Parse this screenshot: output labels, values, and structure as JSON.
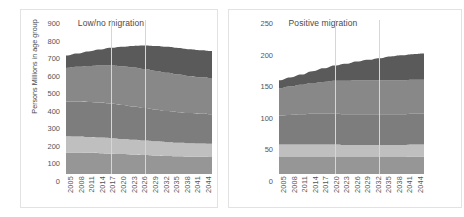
{
  "chart_data": [
    {
      "type": "area",
      "title": "Low/no migration",
      "xlabel": "",
      "ylabel": "Persons Millions in age group",
      "stacked": true,
      "grid": false,
      "legend_position": "right-shared",
      "ylim": [
        0,
        900
      ],
      "yticks": [
        0,
        100,
        200,
        300,
        400,
        500,
        600,
        700,
        800,
        900
      ],
      "x": [
        2005,
        2008,
        2011,
        2014,
        2017,
        2020,
        2023,
        2026,
        2029,
        2032,
        2035,
        2038,
        2041,
        2044
      ],
      "categories": [
        "2005",
        "2008",
        "2011",
        "2014",
        "2017",
        "2020",
        "2023",
        "2026",
        "2029",
        "2032",
        "2035",
        "2038",
        "2041",
        "2044"
      ],
      "series": [
        {
          "name": "0-14 yrs",
          "values": [
            137,
            136,
            134,
            132,
            129,
            126,
            123,
            120,
            117,
            114,
            112,
            110,
            109,
            108
          ]
        },
        {
          "name": "15-24 yrs",
          "values": [
            102,
            101,
            100,
            99,
            98,
            96,
            94,
            92,
            90,
            88,
            86,
            85,
            84,
            83
          ]
        },
        {
          "name": "25-44 yrs",
          "values": [
            220,
            222,
            223,
            222,
            220,
            216,
            211,
            206,
            201,
            197,
            194,
            191,
            189,
            188
          ]
        },
        {
          "name": "45-69 yrs",
          "values": [
            213,
            220,
            228,
            235,
            241,
            245,
            247,
            247,
            245,
            242,
            238,
            234,
            231,
            229
          ]
        },
        {
          "name": "70-plus yrs",
          "values": [
            79,
            85,
            92,
            101,
            112,
            124,
            137,
            149,
            158,
            165,
            169,
            171,
            172,
            172
          ]
        }
      ],
      "totals": [
        751,
        764,
        777,
        789,
        800,
        807,
        812,
        814,
        811,
        806,
        799,
        791,
        785,
        780
      ]
    },
    {
      "type": "area",
      "title": "Positive migration",
      "xlabel": "",
      "ylabel": "",
      "stacked": true,
      "grid": false,
      "legend_position": "right-shared",
      "ylim": [
        0,
        250
      ],
      "yticks": [
        0,
        50,
        100,
        150,
        200,
        250
      ],
      "x": [
        2005,
        2008,
        2011,
        2014,
        2017,
        2020,
        2023,
        2026,
        2029,
        2032,
        2035,
        2038,
        2041,
        2044
      ],
      "categories": [
        "2005",
        "2008",
        "2011",
        "2014",
        "2017",
        "2020",
        "2023",
        "2026",
        "2029",
        "2032",
        "2035",
        "2038",
        "2041",
        "2044"
      ],
      "series": [
        {
          "name": "0-14 yrs",
          "values": [
            30,
            30,
            30,
            30,
            30,
            30,
            30,
            30,
            30,
            30,
            30,
            30,
            31,
            31
          ]
        },
        {
          "name": "15-24 yrs",
          "values": [
            22,
            22,
            22,
            22,
            22,
            22,
            21,
            21,
            21,
            21,
            21,
            21,
            21,
            21
          ]
        },
        {
          "name": "25-44 yrs",
          "values": [
            51,
            52,
            53,
            54,
            54,
            54,
            54,
            54,
            54,
            54,
            54,
            54,
            54,
            54
          ]
        },
        {
          "name": "45-69 yrs",
          "values": [
            48,
            50,
            52,
            54,
            56,
            58,
            59,
            60,
            60,
            60,
            60,
            60,
            60,
            60
          ]
        },
        {
          "name": "70-plus yrs",
          "values": [
            14,
            16,
            18,
            21,
            24,
            27,
            30,
            33,
            36,
            39,
            42,
            44,
            45,
            46
          ]
        }
      ],
      "totals": [
        165,
        170,
        175,
        181,
        186,
        191,
        194,
        198,
        201,
        204,
        207,
        209,
        211,
        212
      ]
    }
  ],
  "legend": {
    "items": [
      {
        "label": "70-plus yrs",
        "color": "#5a5a5a"
      },
      {
        "label": "45-69 yrs",
        "color": "#888888"
      },
      {
        "label": "25-44 yrs",
        "color": "#7d7d7d"
      },
      {
        "label": "15-24 yrs",
        "color": "#bfbfbf"
      },
      {
        "label": "0-14 yrs",
        "color": "#969696"
      }
    ]
  },
  "colors": {
    "band_0_14": "#969696",
    "band_15_24": "#bfbfbf",
    "band_25_44": "#7d7d7d",
    "band_45_69": "#888888",
    "band_70_plus": "#5a5a5a",
    "panel_border": "#e2e2e2",
    "gridline": "#d6d6d6",
    "text": "#4a4a4a",
    "background": "#ffffff"
  }
}
